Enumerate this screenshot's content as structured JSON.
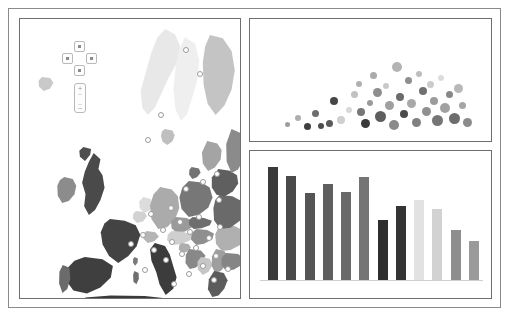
{
  "dashboard": {
    "title": "Europe Analytics Dashboard",
    "background": "#ffffff",
    "frame_color": "#8a8a8a"
  },
  "map_panel": {
    "name": "Europe choropleth map",
    "pan_control": {
      "up_label": "Pan north",
      "down_label": "Pan south",
      "left_label": "Pan west",
      "right_label": "Pan east"
    },
    "zoom_control": {
      "zoom_in_label": "+",
      "zoom_out_label": "−"
    },
    "ocean_color": "#ffffff",
    "border_color": "#ffffff",
    "regions": [
      {
        "name": "norway",
        "shade": "#e8e8e8",
        "left": 118,
        "top": 10,
        "width": 44,
        "height": 86,
        "clip": "polygon(62% 0%, 84% 6%, 96% 20%, 88% 40%, 70% 56%, 54% 74%, 38% 92%, 22% 100%, 10% 92%, 6% 72%, 18% 50%, 30% 28%, 44% 10%)"
      },
      {
        "name": "sweden",
        "shade": "#efefef",
        "left": 150,
        "top": 18,
        "width": 34,
        "height": 84,
        "clip": "polygon(44% 0%, 74% 8%, 86% 28%, 80% 52%, 64% 74%, 50% 92%, 32% 100%, 16% 86%, 10% 62%, 16% 38%, 26% 16%)"
      },
      {
        "name": "finland",
        "shade": "#c4c4c4",
        "left": 178,
        "top": 16,
        "width": 40,
        "height": 80,
        "clip": "polygon(30% 0%, 62% 4%, 84% 20%, 92% 44%, 84% 68%, 66% 88%, 44% 100%, 24% 86%, 14% 62%, 12% 34%, 18% 14%)"
      },
      {
        "name": "denmark",
        "shade": "#bfbfbf",
        "left": 140,
        "top": 110,
        "width": 16,
        "height": 16,
        "clip": "polygon(30% 0%, 78% 10%, 92% 40%, 78% 76%, 46% 100%, 16% 80%, 6% 44%, 12% 16%)"
      },
      {
        "name": "iceland-isle",
        "shade": "#c9c9c9",
        "left": 18,
        "top": 58,
        "width": 16,
        "height": 14,
        "clip": "polygon(24% 0%, 76% 8%, 96% 42%, 74% 84%, 34% 100%, 6% 66%, 4% 26%)"
      },
      {
        "name": "united-kingdom",
        "shade": "#4a4a4a",
        "left": 56,
        "top": 134,
        "width": 34,
        "height": 62,
        "clip": "polygon(52% 0%, 72% 10%, 66% 26%, 78% 36%, 84% 56%, 72% 76%, 56% 92%, 38% 100%, 24% 86%, 28% 66%, 18% 48%, 26% 30%, 38% 14%)"
      },
      {
        "name": "scotland-north",
        "shade": "#4f4f4f",
        "left": 58,
        "top": 128,
        "width": 16,
        "height": 14,
        "clip": "polygon(34% 0%, 82% 14%, 76% 56%, 44% 100%, 12% 70%, 8% 26%)"
      },
      {
        "name": "ireland",
        "shade": "#8c8c8c",
        "left": 36,
        "top": 158,
        "width": 22,
        "height": 26,
        "clip": "polygon(38% 0%, 76% 8%, 92% 34%, 84% 66%, 58% 92%, 28% 100%, 8% 72%, 6% 34%, 18% 12%)"
      },
      {
        "name": "france",
        "shade": "#434343",
        "left": 78,
        "top": 200,
        "width": 46,
        "height": 44,
        "clip": "polygon(26% 0%, 58% 4%, 82% 14%, 92% 36%, 84% 62%, 66% 84%, 44% 100%, 24% 84%, 10% 58%, 6% 30%, 14% 10%)"
      },
      {
        "name": "spain",
        "shade": "#3f3f3f",
        "left": 44,
        "top": 238,
        "width": 52,
        "height": 38,
        "clip": "polygon(40% 0%, 74% 6%, 94% 24%, 90% 54%, 70% 80%, 44% 96%, 18% 88%, 4% 62%, 6% 30%, 20% 10%)"
      },
      {
        "name": "portugal",
        "shade": "#6b6b6b",
        "left": 38,
        "top": 246,
        "width": 14,
        "height": 28,
        "clip": "polygon(34% 0%, 82% 10%, 88% 50%, 66% 86%, 32% 100%, 8% 66%, 10% 24%)"
      },
      {
        "name": "belgium",
        "shade": "#d2d2d2",
        "left": 112,
        "top": 192,
        "width": 16,
        "height": 12,
        "clip": "polygon(24% 0%, 78% 8%, 94% 44%, 70% 86%, 32% 100%, 6% 62%, 8% 22%)"
      },
      {
        "name": "netherlands",
        "shade": "#dcdcdc",
        "left": 118,
        "top": 178,
        "width": 16,
        "height": 16,
        "clip": "polygon(32% 0%, 80% 12%, 92% 48%, 72% 84%, 38% 100%, 10% 68%, 8% 28%)"
      },
      {
        "name": "germany",
        "shade": "#ababab",
        "left": 128,
        "top": 168,
        "width": 34,
        "height": 42,
        "clip": "polygon(36% 0%, 70% 6%, 88% 22%, 92% 50%, 80% 76%, 56% 96%, 30% 100%, 10% 76%, 6% 44%, 16% 18%)"
      },
      {
        "name": "poland",
        "shade": "#777777",
        "left": 158,
        "top": 162,
        "width": 36,
        "height": 36,
        "clip": "polygon(30% 0%, 66% 4%, 88% 18%, 96% 46%, 84% 74%, 58% 94%, 30% 100%, 10% 78%, 4% 46%, 12% 18%)"
      },
      {
        "name": "czechia",
        "shade": "#9a9a9a",
        "left": 150,
        "top": 198,
        "width": 26,
        "height": 16,
        "clip": "polygon(22% 0%, 64% 6%, 90% 26%, 86% 62%, 58% 90%, 26% 100%, 6% 70%, 4% 28%)"
      },
      {
        "name": "austria",
        "shade": "#cfcfcf",
        "left": 146,
        "top": 212,
        "width": 28,
        "height": 14,
        "clip": "polygon(20% 0%, 62% 6%, 92% 28%, 88% 64%, 56% 92%, 24% 100%, 4% 66%, 6% 26%)"
      },
      {
        "name": "switzerland",
        "shade": "#b5b5b5",
        "left": 122,
        "top": 212,
        "width": 18,
        "height": 12,
        "clip": "polygon(26% 0%, 74% 10%, 94% 46%, 68% 86%, 32% 100%, 8% 64%, 6% 24%)"
      },
      {
        "name": "hungary",
        "shade": "#8f8f8f",
        "left": 170,
        "top": 210,
        "width": 26,
        "height": 16,
        "clip": "polygon(24% 0%, 66% 6%, 92% 28%, 86% 64%, 54% 92%, 24% 100%, 4% 66%, 6% 26%)"
      },
      {
        "name": "slovakia",
        "shade": "#6e6e6e",
        "left": 168,
        "top": 198,
        "width": 26,
        "height": 12,
        "clip": "polygon(18% 0%, 62% 8%, 92% 32%, 84% 68%, 52% 94%, 22% 100%, 4% 64%, 4% 24%)"
      },
      {
        "name": "italy",
        "shade": "#3c3c3c",
        "left": 126,
        "top": 224,
        "width": 34,
        "height": 52,
        "clip": "polygon(26% 0%, 56% 6%, 70% 22%, 80% 44%, 90% 66%, 80% 88%, 58% 100%, 40% 80%, 30% 56%, 16% 34%, 12% 12%)"
      },
      {
        "name": "sardinia",
        "shade": "#6f6f6f",
        "left": 112,
        "top": 252,
        "width": 8,
        "height": 14,
        "clip": "polygon(30% 0%, 82% 14%, 86% 56%, 56% 94%, 18% 76%, 14% 26%)"
      },
      {
        "name": "corsica",
        "shade": "#7a7a7a",
        "left": 112,
        "top": 238,
        "width": 7,
        "height": 9,
        "clip": "polygon(32% 0%, 84% 18%, 80% 62%, 46% 96%, 14% 64%, 16% 24%)"
      },
      {
        "name": "slovenia",
        "shade": "#aeaeae",
        "left": 158,
        "top": 224,
        "width": 14,
        "height": 10,
        "clip": "polygon(26% 0%, 76% 10%, 92% 48%, 66% 88%, 28% 100%, 6% 62%, 8% 22%)"
      },
      {
        "name": "croatia",
        "shade": "#888888",
        "left": 164,
        "top": 230,
        "width": 24,
        "height": 20,
        "clip": "polygon(22% 0%, 70% 8%, 90% 34%, 72% 66%, 50% 92%, 24% 100%, 6% 70%, 8% 28%)"
      },
      {
        "name": "bosnia",
        "shade": "#c6c6c6",
        "left": 176,
        "top": 238,
        "width": 18,
        "height": 18,
        "clip": "polygon(28% 0%, 76% 10%, 92% 44%, 70% 82%, 38% 100%, 10% 68%, 8% 26%)"
      },
      {
        "name": "serbia",
        "shade": "#9e9e9e",
        "left": 190,
        "top": 230,
        "width": 20,
        "height": 24,
        "clip": "polygon(30% 0%, 72% 8%, 90% 34%, 80% 66%, 54% 92%, 26% 100%, 8% 70%, 10% 30%)"
      },
      {
        "name": "romania",
        "shade": "#b0b0b0",
        "left": 194,
        "top": 206,
        "width": 32,
        "height": 26,
        "clip": "polygon(26% 0%, 64% 4%, 90% 20%, 96% 50%, 80% 78%, 52% 96%, 24% 100%, 6% 72%, 4% 36%, 12% 14%)"
      },
      {
        "name": "bulgaria",
        "shade": "#858585",
        "left": 200,
        "top": 234,
        "width": 26,
        "height": 18,
        "clip": "polygon(24% 0%, 70% 6%, 92% 30%, 84% 66%, 54% 92%, 24% 100%, 6% 68%, 6% 26%)"
      },
      {
        "name": "greece",
        "shade": "#5c5c5c",
        "left": 186,
        "top": 252,
        "width": 24,
        "height": 26,
        "clip": "polygon(34% 0%, 74% 8%, 90% 36%, 76% 68%, 52% 94%, 26% 100%, 8% 70%, 12% 32%)"
      },
      {
        "name": "ukraine-west",
        "shade": "#6a6a6a",
        "left": 192,
        "top": 176,
        "width": 34,
        "height": 34,
        "clip": "polygon(22% 0%, 60% 4%, 88% 18%, 96% 48%, 82% 76%, 54% 96%, 24% 100%, 6% 74%, 4% 38%, 10% 14%)"
      },
      {
        "name": "belarus",
        "shade": "#5f5f5f",
        "left": 190,
        "top": 150,
        "width": 30,
        "height": 28,
        "clip": "polygon(28% 0%, 66% 6%, 90% 22%, 94% 52%, 76% 80%, 48% 98%, 22% 92%, 6% 66%, 6% 30%)"
      },
      {
        "name": "baltic-states",
        "shade": "#a4a4a4",
        "left": 180,
        "top": 122,
        "width": 24,
        "height": 30,
        "clip": "polygon(30% 0%, 72% 8%, 90% 30%, 86% 62%, 62% 88%, 34% 100%, 12% 76%, 8% 38%)"
      },
      {
        "name": "russia-kalin",
        "shade": "#737373",
        "left": 168,
        "top": 148,
        "width": 14,
        "height": 12,
        "clip": "polygon(26% 0%, 78% 12%, 90% 48%, 64% 86%, 30% 100%, 8% 62%, 10% 22%)"
      },
      {
        "name": "russia-north",
        "shade": "#8b8b8b",
        "left": 204,
        "top": 110,
        "width": 22,
        "height": 44,
        "clip": "polygon(34% 0%, 78% 10%, 94% 38%, 88% 70%, 64% 92%, 34% 100%, 12% 74%, 10% 34%)"
      },
      {
        "name": "north-africa",
        "shade": "#3a3a3a",
        "left": 60,
        "top": 276,
        "width": 90,
        "height": 14,
        "clip": "polygon(6% 18%, 34% 4%, 72% 8%, 96% 24%, 94% 70%, 60% 96%, 22% 92%, 2% 60%)"
      }
    ],
    "nodes": [
      {
        "id": 1,
        "left": 163,
        "top": 28
      },
      {
        "id": 2,
        "left": 177,
        "top": 52
      },
      {
        "id": 3,
        "left": 138,
        "top": 93
      },
      {
        "id": 4,
        "left": 125,
        "top": 118
      },
      {
        "id": 5,
        "left": 194,
        "top": 152
      },
      {
        "id": 6,
        "left": 180,
        "top": 160
      },
      {
        "id": 7,
        "left": 163,
        "top": 167
      },
      {
        "id": 8,
        "left": 196,
        "top": 178
      },
      {
        "id": 9,
        "left": 148,
        "top": 186
      },
      {
        "id": 10,
        "left": 128,
        "top": 192
      },
      {
        "id": 11,
        "left": 176,
        "top": 195
      },
      {
        "id": 12,
        "left": 157,
        "top": 200
      },
      {
        "id": 13,
        "left": 197,
        "top": 205
      },
      {
        "id": 14,
        "left": 140,
        "top": 208
      },
      {
        "id": 15,
        "left": 167,
        "top": 210
      },
      {
        "id": 16,
        "left": 120,
        "top": 213
      },
      {
        "id": 17,
        "left": 186,
        "top": 216
      },
      {
        "id": 18,
        "left": 149,
        "top": 220
      },
      {
        "id": 19,
        "left": 108,
        "top": 222
      },
      {
        "id": 20,
        "left": 173,
        "top": 226
      },
      {
        "id": 21,
        "left": 131,
        "top": 228
      },
      {
        "id": 22,
        "left": 159,
        "top": 232
      },
      {
        "id": 23,
        "left": 193,
        "top": 234
      },
      {
        "id": 24,
        "left": 143,
        "top": 238
      },
      {
        "id": 25,
        "left": 180,
        "top": 244
      },
      {
        "id": 26,
        "left": 205,
        "top": 247
      },
      {
        "id": 27,
        "left": 122,
        "top": 248
      },
      {
        "id": 28,
        "left": 166,
        "top": 252
      },
      {
        "id": 29,
        "left": 191,
        "top": 258
      },
      {
        "id": 30,
        "left": 151,
        "top": 262
      }
    ]
  },
  "chart_data": [
    {
      "type": "scatter",
      "name": "bubble-chart",
      "title": "",
      "xlabel": "",
      "ylabel": "",
      "xlim": [
        0,
        100
      ],
      "ylim": [
        0,
        100
      ],
      "grid": false,
      "legend": "none",
      "note": "Bubble scatter; size encodes magnitude, gray shade encodes category",
      "points": [
        {
          "x": 12.5,
          "y": 8,
          "r": 2.5,
          "shade": "#9d9d9d"
        },
        {
          "x": 17.0,
          "y": 14,
          "r": 3.0,
          "shade": "#aeaeae"
        },
        {
          "x": 21.5,
          "y": 6,
          "r": 3.5,
          "shade": "#3f3f3f"
        },
        {
          "x": 25.0,
          "y": 18,
          "r": 3.5,
          "shade": "#6e6e6e"
        },
        {
          "x": 27.5,
          "y": 7,
          "r": 3.0,
          "shade": "#4d4d4d"
        },
        {
          "x": 31.0,
          "y": 9,
          "r": 3.5,
          "shade": "#5a5a5a"
        },
        {
          "x": 33.0,
          "y": 30,
          "r": 4.0,
          "shade": "#474747"
        },
        {
          "x": 36.5,
          "y": 12,
          "r": 4.0,
          "shade": "#cfcfcf"
        },
        {
          "x": 40.0,
          "y": 22,
          "r": 3.0,
          "shade": "#d8d8d8"
        },
        {
          "x": 42.5,
          "y": 36,
          "r": 3.5,
          "shade": "#c2c2c2"
        },
        {
          "x": 44.5,
          "y": 46,
          "r": 3.0,
          "shade": "#b0b0b0"
        },
        {
          "x": 45.5,
          "y": 20,
          "r": 4.0,
          "shade": "#777777"
        },
        {
          "x": 47.5,
          "y": 9,
          "r": 4.5,
          "shade": "#3a3a3a"
        },
        {
          "x": 49.5,
          "y": 28,
          "r": 3.0,
          "shade": "#9a9a9a"
        },
        {
          "x": 51.0,
          "y": 54,
          "r": 3.5,
          "shade": "#aaaaaa"
        },
        {
          "x": 52.5,
          "y": 38,
          "r": 4.5,
          "shade": "#8e8e8e"
        },
        {
          "x": 54.0,
          "y": 16,
          "r": 5.5,
          "shade": "#5e5e5e"
        },
        {
          "x": 56.5,
          "y": 44,
          "r": 3.0,
          "shade": "#c8c8c8"
        },
        {
          "x": 58.0,
          "y": 26,
          "r": 4.5,
          "shade": "#9f9f9f"
        },
        {
          "x": 60.0,
          "y": 8,
          "r": 5.0,
          "shade": "#8a8a8a"
        },
        {
          "x": 61.5,
          "y": 62,
          "r": 5.0,
          "shade": "#b4b4b4"
        },
        {
          "x": 63.0,
          "y": 34,
          "r": 4.0,
          "shade": "#6b6b6b"
        },
        {
          "x": 64.5,
          "y": 18,
          "r": 4.0,
          "shade": "#4a4a4a"
        },
        {
          "x": 66.5,
          "y": 50,
          "r": 3.5,
          "shade": "#8f8f8f"
        },
        {
          "x": 68.0,
          "y": 28,
          "r": 4.5,
          "shade": "#a8a8a8"
        },
        {
          "x": 70.0,
          "y": 10,
          "r": 4.5,
          "shade": "#808080"
        },
        {
          "x": 71.5,
          "y": 56,
          "r": 3.0,
          "shade": "#bdbdbd"
        },
        {
          "x": 73.0,
          "y": 40,
          "r": 4.0,
          "shade": "#707070"
        },
        {
          "x": 74.5,
          "y": 20,
          "r": 4.5,
          "shade": "#909090"
        },
        {
          "x": 76.5,
          "y": 46,
          "r": 3.5,
          "shade": "#cccccc"
        },
        {
          "x": 78.0,
          "y": 30,
          "r": 4.0,
          "shade": "#9c9c9c"
        },
        {
          "x": 79.5,
          "y": 12,
          "r": 5.5,
          "shade": "#757575"
        },
        {
          "x": 81.0,
          "y": 52,
          "r": 3.0,
          "shade": "#dcdcdc"
        },
        {
          "x": 83.0,
          "y": 24,
          "r": 5.0,
          "shade": "#a0a0a0"
        },
        {
          "x": 85.0,
          "y": 36,
          "r": 3.5,
          "shade": "#888888"
        },
        {
          "x": 87.0,
          "y": 14,
          "r": 5.5,
          "shade": "#6d6d6d"
        },
        {
          "x": 89.0,
          "y": 42,
          "r": 4.5,
          "shade": "#b8b8b8"
        },
        {
          "x": 91.0,
          "y": 26,
          "r": 3.5,
          "shade": "#a5a5a5"
        },
        {
          "x": 93.0,
          "y": 10,
          "r": 4.5,
          "shade": "#8b8b8b"
        }
      ]
    },
    {
      "type": "bar",
      "name": "bar-chart",
      "title": "",
      "xlabel": "",
      "ylabel": "",
      "ylim": [
        0,
        100
      ],
      "grid": false,
      "legend": "none",
      "categories": [
        "1",
        "2",
        "3",
        "4",
        "5",
        "6",
        "7",
        "8",
        "9",
        "10",
        "11",
        "12"
      ],
      "values": [
        93,
        86,
        72,
        79,
        73,
        85,
        50,
        61,
        66,
        59,
        41,
        32
      ],
      "shades": [
        "#3a3a3a",
        "#4a4a4a",
        "#555555",
        "#5f5f5f",
        "#6a6a6a",
        "#757575",
        "#2e2e2e",
        "#343434",
        "#e2e2e2",
        "#d2d2d2",
        "#8e8e8e",
        "#9a9a9a"
      ]
    }
  ]
}
